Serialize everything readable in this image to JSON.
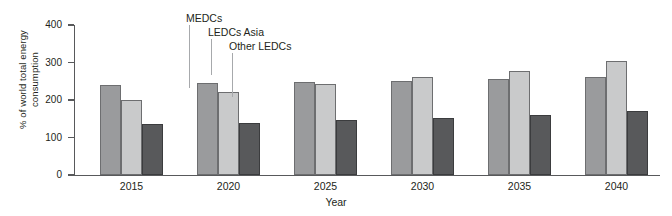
{
  "chart_data": {
    "type": "bar",
    "title": "",
    "xlabel": "Year",
    "ylabel": "% of world total energy\nconsumption",
    "categories": [
      "2015",
      "2020",
      "2025",
      "2030",
      "2035",
      "2040"
    ],
    "series": [
      {
        "name": "MEDCs",
        "color": "#9a9b9d",
        "values": [
          240,
          245,
          248,
          250,
          255,
          262
        ]
      },
      {
        "name": "LEDCs Asia",
        "color": "#c9cacb",
        "values": [
          200,
          221,
          243,
          262,
          278,
          303
        ]
      },
      {
        "name": "Other LEDCs",
        "color": "#58595b",
        "values": [
          135,
          139,
          147,
          152,
          161,
          170
        ]
      }
    ],
    "ylim": [
      0,
      400
    ],
    "yticks": [
      0,
      100,
      200,
      300,
      400
    ],
    "ytick_labels": [
      "0",
      "100",
      "200",
      "300",
      "400"
    ],
    "grid": false,
    "legend_position": "annotations-above-2020-group",
    "annotations": [
      {
        "text": "MEDCs",
        "target_series": "MEDCs"
      },
      {
        "text": "LEDCs Asia",
        "target_series": "LEDCs Asia"
      },
      {
        "text": "Other LEDCs",
        "target_series": "Other LEDCs"
      }
    ]
  },
  "axes": {
    "y_title": "% of world total energy\nconsumption",
    "x_title": "Year"
  },
  "colors": {
    "axis": "#58595b",
    "text": "#231f20",
    "leader": "#a7a9ac",
    "background": "#ffffff"
  }
}
